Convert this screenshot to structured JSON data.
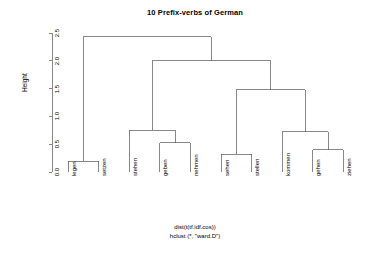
{
  "plot": {
    "title": "10 Prefix-verbs of German",
    "ylabel": "Height",
    "footer_line1": "dist(t(tf.idf.cos))",
    "footer_line2": "hclust (*, \"ward.D\")",
    "line_color": "#555555",
    "text_color": "#000000",
    "background": "#ffffff"
  },
  "chart_data": {
    "type": "dendrogram",
    "title": "10 Prefix-verbs of German",
    "xlabel": "",
    "ylabel": "Height",
    "ylim": [
      0.0,
      2.5
    ],
    "yticks": [
      "0.0",
      "0.5",
      "1.0",
      "1.5",
      "2.0",
      "2.5"
    ],
    "ytick_values": [
      0.0,
      0.5,
      1.0,
      1.5,
      2.0,
      2.5
    ],
    "grid": false,
    "legend": "none",
    "distance": "dist(t(tf.idf.cos))",
    "method": "hclust (*, \"ward.D\")",
    "leaves": [
      "legen",
      "setzen",
      "stehen",
      "geben",
      "nehmen",
      "sehen",
      "stellen",
      "kommen",
      "gehen",
      "ziehen"
    ],
    "merges": [
      {
        "id": "m1",
        "children": [
          "legen",
          "setzen"
        ],
        "height": 0.19
      },
      {
        "id": "m2",
        "children": [
          "geben",
          "nehmen"
        ],
        "height": 0.53
      },
      {
        "id": "m3",
        "children": [
          "stehen",
          "m2"
        ],
        "height": 0.75
      },
      {
        "id": "m4",
        "children": [
          "sehen",
          "stellen"
        ],
        "height": 0.32
      },
      {
        "id": "m5",
        "children": [
          "gehen",
          "ziehen"
        ],
        "height": 0.4
      },
      {
        "id": "m6",
        "children": [
          "kommen",
          "m5"
        ],
        "height": 0.72
      },
      {
        "id": "m7",
        "children": [
          "m4",
          "m6"
        ],
        "height": 1.48
      },
      {
        "id": "m8",
        "children": [
          "m3",
          "m7"
        ],
        "height": 2.0
      },
      {
        "id": "m9",
        "children": [
          "m1",
          "m8"
        ],
        "height": 2.43
      }
    ]
  }
}
